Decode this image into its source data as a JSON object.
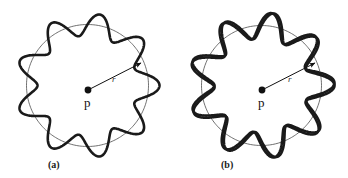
{
  "figure": {
    "background_color": "#ffffff",
    "curve_color": "#1a1a1a",
    "circle_color": "#4a4a4a",
    "arrow_color": "#111111",
    "label_color": "#111111",
    "panels": [
      {
        "id": "a",
        "caption": "(a)",
        "center_label": "p",
        "radius_label": "r",
        "center": {
          "x": 87,
          "y": 85
        },
        "circle_radius": 61,
        "wavy_curves": 1,
        "lobes": 9,
        "amplitude": 11
      },
      {
        "id": "b",
        "caption": "(b)",
        "center_label": "p",
        "radius_label": "r",
        "center": {
          "x": 87,
          "y": 85
        },
        "circle_radius": 60,
        "wavy_curves": 2,
        "lobes": 9,
        "amplitude": 13
      }
    ]
  },
  "chart_data": {
    "type": "line",
    "title": "",
    "xlabel": "",
    "ylabel": "",
    "series": [
      {
        "name": "reference-circle-a",
        "panel": "a",
        "polar": true,
        "r0": 61,
        "amplitude": 0,
        "lobes": 0,
        "phase_deg": 0,
        "stroke_width": 0.8
      },
      {
        "name": "wavy-curve-a",
        "panel": "a",
        "polar": true,
        "r0": 61,
        "amplitude": 11,
        "lobes": 9,
        "phase_deg": 0,
        "stroke_width": 2.6
      },
      {
        "name": "reference-circle-b",
        "panel": "b",
        "polar": true,
        "r0": 60,
        "amplitude": 0,
        "lobes": 0,
        "phase_deg": 0,
        "stroke_width": 0.8
      },
      {
        "name": "wavy-curve-b-1",
        "panel": "b",
        "polar": true,
        "r0": 60,
        "amplitude": 13,
        "lobes": 9,
        "phase_deg": 0,
        "stroke_width": 2.6
      },
      {
        "name": "wavy-curve-b-2",
        "panel": "b",
        "polar": true,
        "r0": 60,
        "amplitude": 13,
        "lobes": 9,
        "phase_deg": 20,
        "stroke_width": 2.6
      }
    ],
    "annotations": [
      {
        "text": "p",
        "panel": "a",
        "kind": "center-point"
      },
      {
        "text": "r",
        "panel": "a",
        "kind": "radius-arrow"
      },
      {
        "text": "(a)",
        "panel": "a",
        "kind": "caption"
      },
      {
        "text": "p",
        "panel": "b",
        "kind": "center-point"
      },
      {
        "text": "r",
        "panel": "b",
        "kind": "radius-arrow"
      },
      {
        "text": "(b)",
        "panel": "b",
        "kind": "caption"
      }
    ]
  }
}
